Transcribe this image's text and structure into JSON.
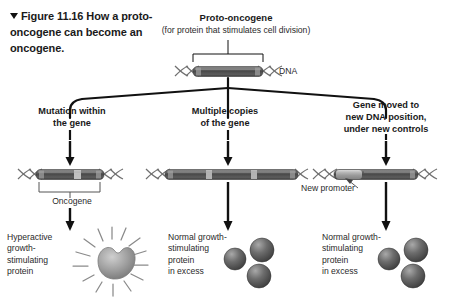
{
  "figure": {
    "marker_icon": "down-triangle-icon",
    "number": "Figure 11.16",
    "title": "How a proto-oncogene can become an oncogene."
  },
  "top": {
    "gene_title": "Proto-oncogene",
    "gene_subtitle": "(for protein that stimulates cell division)",
    "dna_label": "DNA"
  },
  "branches": [
    {
      "heading": "Mutation within\nthe gene",
      "gene_label": "Oncogene",
      "product_caption": "Hyperactive\ngrowth-\nstimulating\nprotein",
      "product_type": "radiating-protein"
    },
    {
      "heading": "Multiple copies\nof the gene",
      "product_caption": "Normal growth-\nstimulating\nprotein\nin excess",
      "product_type": "protein-spheres",
      "protein_count": 3
    },
    {
      "heading": "Gene moved to\nnew DNA position,\nunder new controls",
      "gene_label": "New promoter",
      "product_caption": "Normal growth-\nstimulating\nprotein\nin excess",
      "product_type": "protein-spheres",
      "protein_count": 3
    }
  ],
  "colors": {
    "gene_dark": "#555555",
    "gene_light": "#b9b9b9",
    "protein_gray": "#6e6e6e",
    "line_black": "#111111",
    "helix_gray": "#7d7d7d",
    "text": "#1a1a1a"
  }
}
